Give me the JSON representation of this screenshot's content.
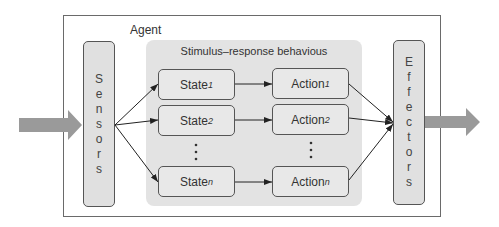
{
  "diagram": {
    "container_label": "Agent",
    "region_label": "Stimulus–response behavious",
    "sensors": {
      "letters": [
        "S",
        "e",
        "n",
        "s",
        "o",
        "r",
        "s"
      ],
      "label": "Sensors"
    },
    "effectors": {
      "letters": [
        "E",
        "f",
        "f",
        "e",
        "c",
        "t",
        "o",
        "r",
        "s"
      ],
      "label": "Effectors"
    },
    "states": [
      {
        "base": "State",
        "sub": "1"
      },
      {
        "base": "State",
        "sub": "2"
      },
      {
        "base": "State",
        "sub": "n"
      }
    ],
    "actions": [
      {
        "base": "Action",
        "sub": "1"
      },
      {
        "base": "Action",
        "sub": "2"
      },
      {
        "base": "Action",
        "sub": "n"
      }
    ],
    "ellipsis": "·\n·\n·",
    "colors": {
      "big_arrow": "#9a9a9a",
      "region_fill": "#e3e3e3",
      "box_fill": "#e8e8e8",
      "border": "#555555"
    },
    "flow": [
      "input -> Sensors",
      "Sensors -> State_1",
      "Sensors -> State_2",
      "Sensors -> State_n",
      "State_1 -> Action_1",
      "State_2 -> Action_2",
      "State_n -> Action_n",
      "Action_1 -> Effectors",
      "Action_2 -> Effectors",
      "Action_n -> Effectors",
      "Effectors -> output"
    ]
  }
}
